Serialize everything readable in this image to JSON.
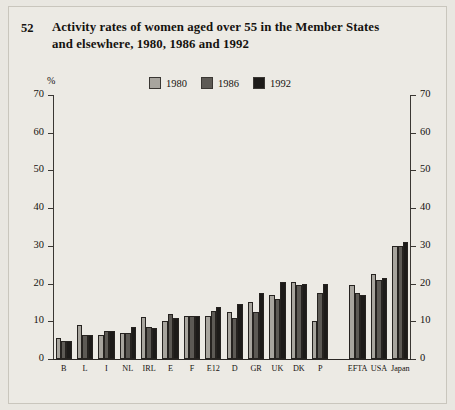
{
  "figure": {
    "number": "52",
    "title": "Activity rates of women aged over 55 in the Member States and elsewhere, 1980, 1986 and 1992"
  },
  "legend": {
    "position": "top-center",
    "items": [
      {
        "label": "1980",
        "color": "#a8a59e"
      },
      {
        "label": "1986",
        "color": "#5d5a55"
      },
      {
        "label": "1992",
        "color": "#1d1b19"
      }
    ]
  },
  "axes": {
    "unit": "%",
    "ticks": [
      "70",
      "60",
      "50",
      "40",
      "30",
      "20",
      "10",
      "0"
    ],
    "left_ticks": [
      "70",
      "60",
      "50",
      "40",
      "30",
      "20",
      "10",
      "0"
    ],
    "right_ticks": [
      "70",
      "60",
      "50",
      "40",
      "30",
      "20",
      "10",
      "0"
    ]
  },
  "chart_data": {
    "type": "bar",
    "title": "Activity rates of women aged over 55 in the Member States and elsewhere, 1980, 1986 and 1992",
    "xlabel": "",
    "ylabel": "%",
    "ylim": [
      0,
      70
    ],
    "ytick_step": 10,
    "grid": false,
    "legend_position": "top-center",
    "categories": [
      "B",
      "L",
      "I",
      "NL",
      "IRL",
      "E",
      "F",
      "E12",
      "D",
      "GR",
      "UK",
      "DK",
      "P",
      "EFTA",
      "USA",
      "Japan"
    ],
    "group_break_after": "P",
    "series": [
      {
        "name": "1980",
        "color": "#a8a59e",
        "values": [
          5.5,
          9.0,
          6.5,
          7.0,
          11.2,
          10.0,
          11.5,
          11.5,
          12.5,
          15.0,
          17.0,
          20.5,
          10.0,
          19.5,
          22.5,
          30.0
        ]
      },
      {
        "name": "1986",
        "color": "#5d5a55",
        "values": [
          4.8,
          6.5,
          7.5,
          6.8,
          8.5,
          12.0,
          11.3,
          12.8,
          11.0,
          12.5,
          16.0,
          19.5,
          17.5,
          17.5,
          21.0,
          30.0
        ]
      },
      {
        "name": "1992",
        "color": "#1d1b19",
        "values": [
          4.8,
          6.3,
          7.5,
          8.5,
          8.3,
          11.0,
          11.5,
          13.8,
          14.5,
          17.5,
          20.5,
          20.0,
          20.0,
          17.0,
          21.5,
          31.0
        ]
      }
    ]
  }
}
